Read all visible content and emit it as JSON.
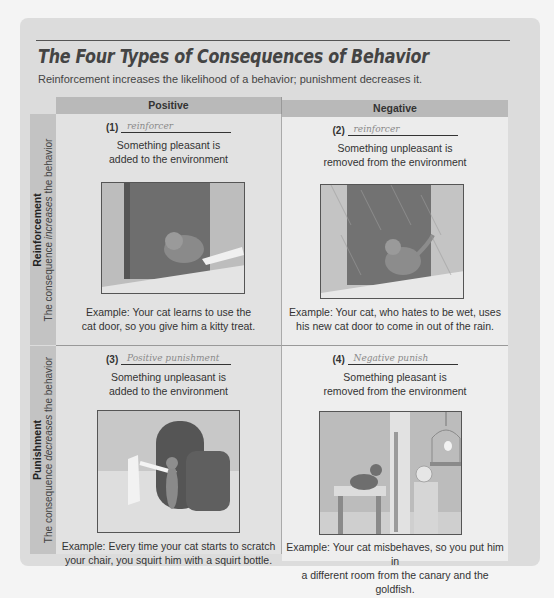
{
  "title": "The Four Types of Consequences of Behavior",
  "subtitle": "Reinforcement increases the likelihood of a behavior; punishment decreases it.",
  "columns": {
    "positive": "Positive",
    "negative": "Negative"
  },
  "rows": {
    "reinforcement": {
      "label": "Reinforcement",
      "caption_pre": "The consequence ",
      "caption_em": "increases",
      "caption_post": " the behavior"
    },
    "punishment": {
      "label": "Punishment",
      "caption_pre": "The consequence ",
      "caption_em": "decreases",
      "caption_post": " the behavior"
    }
  },
  "cells": [
    {
      "number": "(1)",
      "handwritten": "reinforcer",
      "desc_line1": "Something pleasant is",
      "desc_line2": "added to the environment",
      "image": "cat-door-treat-photo",
      "example_line1": "Example: Your cat learns to use the",
      "example_line2": "cat door, so you give him a kitty treat."
    },
    {
      "number": "(2)",
      "handwritten": "reinforcer",
      "desc_line1": "Something unpleasant is",
      "desc_line2": "removed from the environment",
      "image": "cat-door-rain-photo",
      "example_line1": "Example: Your cat, who hates to be wet, uses",
      "example_line2": "his new cat door to come in out of the rain."
    },
    {
      "number": "(3)",
      "handwritten": "Positive punishment",
      "desc_line1": "Something unpleasant is",
      "desc_line2": "added to the environment",
      "image": "cat-chair-squirt-photo",
      "example_line1": "Example: Every time your cat starts to scratch",
      "example_line2": "your chair, you squirt him with a squirt bottle."
    },
    {
      "number": "(4)",
      "handwritten": "Negative punish",
      "desc_line1": "Something pleasant is",
      "desc_line2": "removed from the environment",
      "image": "cat-canary-goldfish-photo",
      "example_line1": "Example: Your cat misbehaves, so you put him in",
      "example_line2": "a different room from the canary and the goldfish."
    }
  ]
}
